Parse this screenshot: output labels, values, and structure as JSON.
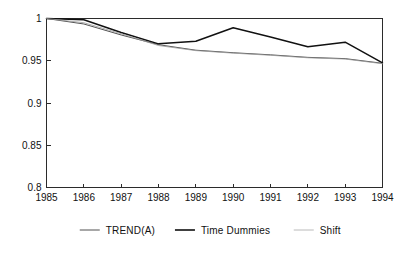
{
  "chart_data": {
    "type": "line",
    "title": "",
    "subtitle": "",
    "xlabel": "",
    "ylabel": "",
    "x": [
      1985,
      1986,
      1987,
      1988,
      1989,
      1990,
      1991,
      1992,
      1993,
      1994
    ],
    "categories": [
      "1985",
      "1986",
      "1987",
      "1988",
      "1989",
      "1990",
      "1991",
      "1992",
      "1993",
      "1994"
    ],
    "xlim": [
      1985,
      1994
    ],
    "ylim": [
      0.8,
      1.0
    ],
    "yticks": [
      0.8,
      0.85,
      0.9,
      0.95,
      1.0
    ],
    "ytick_labels": [
      "0.8",
      "0.85",
      "0.9",
      "0.95",
      "1"
    ],
    "xticks": [
      1985,
      1986,
      1987,
      1988,
      1989,
      1990,
      1991,
      1992,
      1993,
      1994
    ],
    "xtick_labels": [
      "1985",
      "1986",
      "1987",
      "1988",
      "1989",
      "1990",
      "1991",
      "1992",
      "1993",
      "1994"
    ],
    "grid": false,
    "legend_position": "below",
    "series": [
      {
        "name": "TREND(A)",
        "color": "#3d3d3d",
        "width": 0.9,
        "values": [
          1.0,
          0.9935,
          0.9805,
          0.969,
          0.9625,
          0.9595,
          0.957,
          0.954,
          0.9525,
          0.947
        ]
      },
      {
        "name": "Time Dummies",
        "color": "#111111",
        "width": 1.5,
        "values": [
          1.0,
          0.9985,
          0.9835,
          0.97,
          0.973,
          0.989,
          0.978,
          0.9665,
          0.972,
          0.9475
        ]
      },
      {
        "name": "Shift",
        "color": "#9a9a9a",
        "width": 0.8,
        "values": [
          1.0,
          0.995,
          0.982,
          0.968,
          0.962,
          0.959,
          0.9565,
          0.9535,
          0.952,
          0.9465
        ]
      }
    ]
  },
  "legend": {
    "items": [
      {
        "label": "TREND(A)",
        "color": "#3d3d3d",
        "width": 0.9
      },
      {
        "label": "Time Dummies",
        "color": "#111111",
        "width": 1.6
      },
      {
        "label": "Shift",
        "color": "#a8a8a8",
        "width": 0.8
      }
    ]
  },
  "axes": {
    "y_tick_labels": [
      "1",
      "0.95",
      "0.9",
      "0.85",
      "0.8"
    ],
    "x_tick_labels": [
      "1985",
      "1986",
      "1987",
      "1988",
      "1989",
      "1990",
      "1991",
      "1992",
      "1993",
      "1994"
    ]
  }
}
